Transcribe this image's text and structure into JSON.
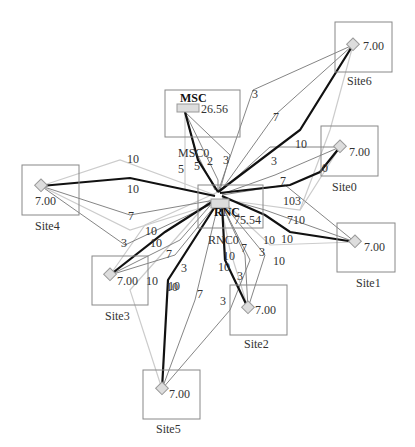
{
  "diagram": {
    "colors": {
      "thick": "#111111",
      "thin": "#777777",
      "light": "#cccccc",
      "box": "#888888",
      "node_fill": "#dddddd"
    },
    "core": {
      "msc": {
        "title": "MSC",
        "value": "26.56",
        "label": "MSC0"
      },
      "rnc": {
        "title": "RNC",
        "value": "75.54",
        "label": "RNC0"
      }
    },
    "sites": [
      {
        "name": "Site0",
        "value": "7.00"
      },
      {
        "name": "Site1",
        "value": "7.00"
      },
      {
        "name": "Site2",
        "value": "7.00"
      },
      {
        "name": "Site3",
        "value": "7.00"
      },
      {
        "name": "Site4",
        "value": "7.00"
      },
      {
        "name": "Site5",
        "value": "7.00"
      },
      {
        "name": "Site6",
        "value": "7.00"
      }
    ],
    "edge_labels": [
      "10",
      "10",
      "7",
      "10",
      "10",
      "7",
      "3",
      "10",
      "10",
      "3",
      "5",
      "5",
      "2",
      "3",
      "3",
      "7",
      "10",
      "3",
      "7",
      "103",
      "710",
      "10",
      "0",
      "10",
      "10",
      "7",
      "3",
      "10",
      "10",
      "7",
      "3",
      "10",
      "3"
    ]
  }
}
